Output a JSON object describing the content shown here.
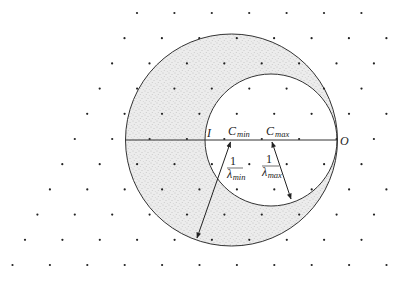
{
  "diagram": {
    "type": "Ewald-sphere construction (limiting spheres)",
    "colors": {
      "line": "#333333",
      "dot": "#222222",
      "shade": "#c8c8c8",
      "background": "#ffffff"
    },
    "lattice": {
      "row0_y": 13,
      "row_dy": 25.2,
      "row0_x": 137,
      "dx": 37.4,
      "row_shift": -12.45,
      "rows": 11
    },
    "big_circle": {
      "cx": 231.5,
      "cy": 140,
      "r": 106
    },
    "small_circle": {
      "cx": 271,
      "cy": 140,
      "r": 66
    },
    "axis": {
      "x1": 126,
      "x2": 337,
      "y": 140
    },
    "points": {
      "I": {
        "label": "I",
        "x": 208,
        "y": 137
      },
      "C_min": {
        "label": "C",
        "sub": "min",
        "x": 229,
        "y": 136
      },
      "C_max": {
        "label": "C",
        "sub": "max",
        "x": 266,
        "y": 136
      },
      "O": {
        "label": "O",
        "x": 340,
        "y": 144
      }
    },
    "radius_labels": {
      "min": {
        "num": "1",
        "den": "λ",
        "sub": "min"
      },
      "max": {
        "num": "1",
        "den": "λ",
        "sub": "max"
      }
    }
  }
}
